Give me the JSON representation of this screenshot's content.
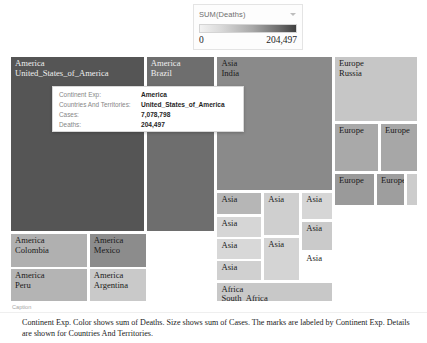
{
  "legend": {
    "title": "SUM(Deaths)",
    "caret_icon": "chevron-down-icon",
    "min": "0",
    "max": "204,497"
  },
  "tooltip": {
    "rows": [
      {
        "key": "Continent Exp:",
        "value": "America"
      },
      {
        "key": "Countries And Territories:",
        "value": "United_States_of_America"
      },
      {
        "key": "Cases:",
        "value": "7,078,798"
      },
      {
        "key": "Deaths:",
        "value": "204,497"
      }
    ]
  },
  "caption": {
    "label": "Caption",
    "text": "Continent Exp.  Color shows sum of Deaths.  Size shows sum of Cases.  The marks are labeled by Continent Exp.  Details are shown for Countries And Territories."
  },
  "chart_data": {
    "type": "treemap",
    "title": "",
    "color_measure": "SUM(Deaths)",
    "size_measure": "SUM(Cases)",
    "color_range": [
      0,
      204497
    ],
    "label_field": "Continent Exp",
    "detail_field": "Countries And Territories",
    "tiles": [
      {
        "continent": "America",
        "country": "United_States_of_America",
        "cases": 7078798,
        "deaths": 204497,
        "x": 0,
        "y": 0,
        "w": 33.0,
        "h": 71.5,
        "shade": "#555555",
        "label_light": true
      },
      {
        "continent": "America",
        "country": "Brazil",
        "cases": 4732309,
        "deaths": 141406,
        "x": 33.3,
        "y": 0,
        "w": 17.0,
        "h": 71.5,
        "shade": "#6e6e6e",
        "label_light": true
      },
      {
        "continent": "Asia",
        "country": "India",
        "cases": 6145291,
        "deaths": 96318,
        "x": 50.6,
        "y": 0,
        "w": 28.5,
        "h": 55.0,
        "shade": "#8a8a8a",
        "label_light": false
      },
      {
        "continent": "Europe",
        "country": "Russia",
        "cases": 1167805,
        "deaths": 20545,
        "x": 79.4,
        "y": 0,
        "w": 20.6,
        "h": 27.0,
        "shade": "#c6c6c6",
        "label_light": false
      },
      {
        "continent": "America",
        "country": "Colombia",
        "cases": 824042,
        "deaths": 25828,
        "x": 0,
        "y": 72.0,
        "w": 19.0,
        "h": 14.0,
        "shade": "#b0b0b0",
        "label_light": false
      },
      {
        "continent": "America",
        "country": "Mexico",
        "cases": 733717,
        "deaths": 76603,
        "x": 19.3,
        "y": 72.0,
        "w": 14.4,
        "h": 14.0,
        "shade": "#8c8c8c",
        "label_light": false
      },
      {
        "continent": "America",
        "country": "Peru",
        "cases": 800142,
        "deaths": 32142,
        "x": 0,
        "y": 86.3,
        "w": 19.0,
        "h": 13.7,
        "shade": "#b4b4b4",
        "label_light": false
      },
      {
        "continent": "America",
        "country": "Argentina",
        "cases": 723132,
        "deaths": 16113,
        "x": 19.3,
        "y": 86.3,
        "w": 14.4,
        "h": 13.7,
        "shade": "#c9c9c9",
        "label_light": false
      },
      {
        "continent": "Asia",
        "country": "Iran",
        "cases": 439882,
        "deaths": 25222,
        "x": 50.6,
        "y": 55.3,
        "w": 11.2,
        "h": 9.5,
        "shade": "#b6b6b6",
        "label_light": false
      },
      {
        "continent": "Asia",
        "country": "Bangladesh",
        "cases": 359148,
        "deaths": 5161,
        "x": 50.6,
        "y": 65.1,
        "w": 11.2,
        "h": 8.7,
        "shade": "#d6d6d6",
        "label_light": false
      },
      {
        "continent": "Asia",
        "country": "Saudi_Arabia",
        "cases": 333648,
        "deaths": 4683,
        "x": 50.6,
        "y": 74.1,
        "w": 11.2,
        "h": 8.7,
        "shade": "#d8d8d8",
        "label_light": false
      },
      {
        "continent": "Asia",
        "country": "Turkey",
        "cases": 316003,
        "deaths": 8157,
        "x": 50.6,
        "y": 83.1,
        "w": 11.2,
        "h": 8.3,
        "shade": "#d0d0d0",
        "label_light": false
      },
      {
        "continent": "Asia",
        "country": "Iraq",
        "cases": 350684,
        "deaths": 9122,
        "x": 62.1,
        "y": 55.3,
        "w": 9.0,
        "h": 18.0,
        "shade": "#cfcfcf",
        "label_light": false
      },
      {
        "continent": "Asia",
        "country": "Pakistan",
        "cases": 311516,
        "deaths": 6444,
        "x": 62.1,
        "y": 73.6,
        "w": 9.0,
        "h": 17.8,
        "shade": "#d4d4d4",
        "label_light": false
      },
      {
        "continent": "Asia",
        "country": "Philippines",
        "cases": 307288,
        "deaths": 5381,
        "x": 71.4,
        "y": 55.3,
        "w": 7.7,
        "h": 11.5,
        "shade": "#d6d6d6",
        "label_light": false
      },
      {
        "continent": "Asia",
        "country": "Indonesia",
        "cases": 278722,
        "deaths": 10473,
        "x": 71.4,
        "y": 67.1,
        "w": 7.7,
        "h": 12.0,
        "shade": "#cacaca",
        "label_light": false
      },
      {
        "continent": "Asia",
        "country": "Israel",
        "cases": 236259,
        "deaths": 1528,
        "x": 71.4,
        "y": 79.4,
        "w": 7.7,
        "h": 12.0,
        "shade": "#dededbe",
        "label_light": false
      },
      {
        "continent": "Africa",
        "country": "South_Africa",
        "cases": 669498,
        "deaths": 16376,
        "x": 50.6,
        "y": 91.7,
        "w": 28.5,
        "h": 8.3,
        "shade": "#c8c8c8",
        "label_light": false
      },
      {
        "continent": "Europe",
        "country": "Spain",
        "cases": 748266,
        "deaths": 31411,
        "x": 79.4,
        "y": 27.3,
        "w": 11.0,
        "h": 20.0,
        "shade": "#a9a9a9",
        "label_light": false
      },
      {
        "continent": "Europe",
        "country": "France",
        "cases": 577505,
        "deaths": 31808,
        "x": 90.7,
        "y": 27.3,
        "w": 9.3,
        "h": 20.0,
        "shade": "#a7a7a7",
        "label_light": false
      },
      {
        "continent": "Europe",
        "country": "United_Kingdom",
        "cases": 446156,
        "deaths": 42143,
        "x": 79.4,
        "y": 47.6,
        "w": 10.0,
        "h": 13.5,
        "shade": "#9a9a9a",
        "label_light": false
      },
      {
        "continent": "Europe",
        "country": "Italy",
        "cases": 314861,
        "deaths": 35894,
        "x": 89.7,
        "y": 47.6,
        "w": 7.0,
        "h": 13.5,
        "shade": "#9e9e9e",
        "label_light": false
      },
      {
        "continent": "Europe",
        "country": "Germany",
        "cases": 288631,
        "deaths": 9488,
        "x": 97.0,
        "y": 47.6,
        "w": 3.0,
        "h": 13.5,
        "shade": "#cccccc",
        "label_light": false
      }
    ]
  }
}
